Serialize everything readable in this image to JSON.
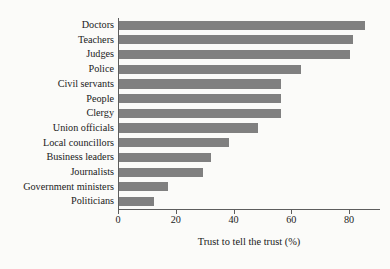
{
  "chart_data": {
    "type": "bar",
    "orientation": "horizontal",
    "title": "",
    "subtitle": "",
    "xlabel": "Trust to tell the trust (%)",
    "ylabel": "",
    "categories": [
      "Doctors",
      "Teachers",
      "Judges",
      "Police",
      "Civil servants",
      "People",
      "Clergy",
      "Union officials",
      "Local councillors",
      "Business leaders",
      "Journalists",
      "Government ministers",
      "Politicians"
    ],
    "values": [
      85,
      81,
      80,
      63,
      56,
      56,
      56,
      48,
      38,
      32,
      29,
      17,
      12
    ],
    "xlim": [
      0,
      90
    ],
    "xticks": [
      0,
      20,
      40,
      60,
      80
    ],
    "xtick_labels": [
      "0",
      "20",
      "40",
      "60",
      "80"
    ],
    "grid": false,
    "legend": null,
    "bar_color": "#808080",
    "axis_color": "#5d5d5d",
    "background_color": "#fbfbf9",
    "text_color": "#1a1a1a"
  }
}
